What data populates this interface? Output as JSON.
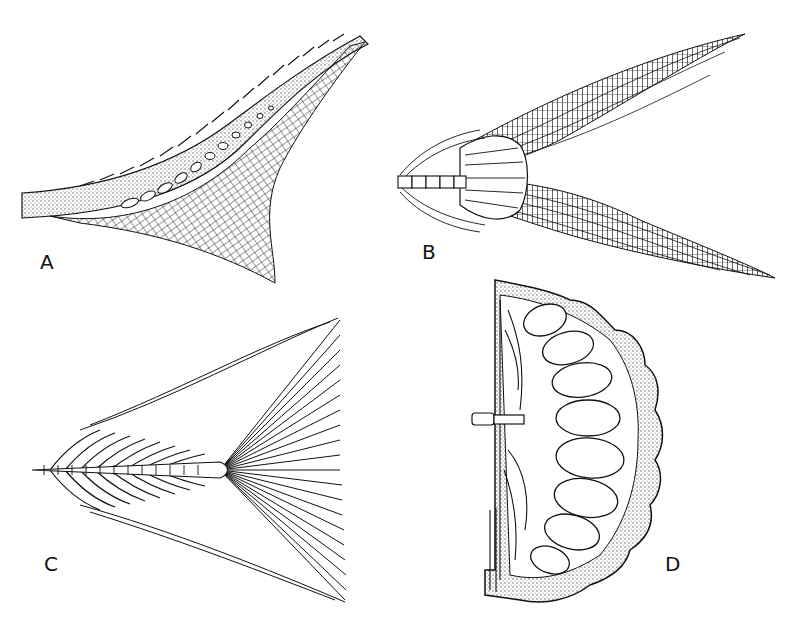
{
  "figure": {
    "panels": [
      {
        "id": "A",
        "label": "A",
        "description": "heterocercal tail fin with scaled upper lobe",
        "color": "#111111"
      },
      {
        "id": "B",
        "label": "B",
        "description": "forked homocercal tail fin skeleton",
        "color": "#111111"
      },
      {
        "id": "C",
        "label": "C",
        "description": "diphycercal tail fin with radiating rays",
        "color": "#111111"
      },
      {
        "id": "D",
        "label": "D",
        "description": "cross-section with stippled lobes",
        "color": "#111111"
      }
    ],
    "background": "#ffffff",
    "ink": "#111111",
    "stipple": "#6a6a6a"
  }
}
